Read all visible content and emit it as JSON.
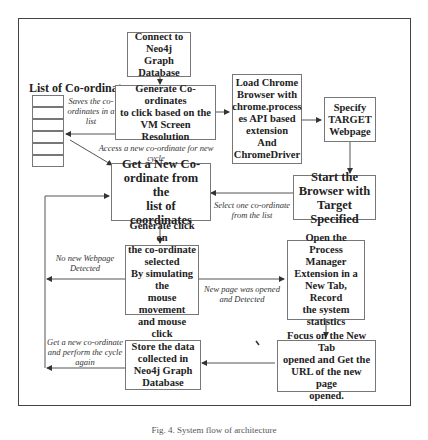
{
  "diagram": {
    "list_title": "List of Co-ordinates",
    "list_cells": 8,
    "boxes": {
      "connect": "Connect to\nNeo4j Graph\nDatabase",
      "generate_coords": "Generate Co-ordinates\nto click based on the\nVM Screen Resolution",
      "load_chrome": "Load Chrome\nBrowser with\nchrome.process\nes API based\nextension\nAnd\nChromeDriver",
      "specify_target": "Specify\nTARGET\nWebpage",
      "start_browser": "Start the\nBrowser with\nTarget Specified",
      "get_new_coord": "Get a New Co-\nordinate from the\nlist of coordinates",
      "generate_click": "Generate click on\nthe co-ordinate\nselected\nBy simulating the\nmouse movement\nand mouse click",
      "open_process_manager": "Open the Process\nManager\nExtension in a\nNew Tab, Record\nthe system\nstatistics",
      "focus_new_tab": "Focus on the New Tab\nopened and Get the\nURL of the new page\nopened.",
      "store_data": "Store the data\ncollected in\nNeo4j Graph\nDatabase"
    },
    "labels": {
      "saves_list": "Saves the co-\nordinates in a\nlist",
      "access_new": "Access a new co-ordinate for new\ncycle",
      "select_one": "Select one co-ordinate\nfrom the list",
      "no_new_page": "No new Webpage\nDetected",
      "new_page_opened": "New page was opened\nand Detected",
      "get_new_cycle": "Get a new co-ordinate\nand perform the cycle\nagain"
    },
    "caption": "Fig. 4.  System flow of architecture"
  }
}
